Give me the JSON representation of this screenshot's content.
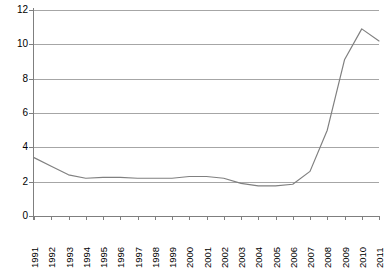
{
  "chart_data": {
    "type": "line",
    "title": "",
    "subtitle": "",
    "xlabel": "",
    "ylabel": "",
    "grid": true,
    "legend": false,
    "legend_position": "none",
    "line_color": "#808080",
    "categories": [
      "1991",
      "1992",
      "1993",
      "1994",
      "1995",
      "1996",
      "1997",
      "1998",
      "1999",
      "2000",
      "2001",
      "2002",
      "2003",
      "2004",
      "2005",
      "2006",
      "2007",
      "2008",
      "2009",
      "2010",
      "2011"
    ],
    "x": [
      1991,
      1992,
      1993,
      1994,
      1995,
      1996,
      1997,
      1998,
      1999,
      2000,
      2001,
      2002,
      2003,
      2004,
      2005,
      2006,
      2007,
      2008,
      2009,
      2010,
      2011
    ],
    "values": [
      3.4,
      2.9,
      2.4,
      2.2,
      2.25,
      2.25,
      2.2,
      2.2,
      2.2,
      2.3,
      2.3,
      2.2,
      1.9,
      1.75,
      1.75,
      1.85,
      2.6,
      5.0,
      9.1,
      10.9,
      10.2
    ],
    "xlim": [
      1991,
      2011
    ],
    "ylim": [
      0,
      12
    ],
    "y_ticks": [
      "0",
      "2",
      "4",
      "6",
      "8",
      "10",
      "12"
    ],
    "y_tick_values": [
      0,
      2,
      4,
      6,
      8,
      10,
      12
    ],
    "x_ticks": [
      "1991",
      "1992",
      "1993",
      "1994",
      "1995",
      "1996",
      "1997",
      "1998",
      "1999",
      "2000",
      "2001",
      "2002",
      "2003",
      "2004",
      "2005",
      "2006",
      "2007",
      "2008",
      "2009",
      "2010",
      "2011"
    ],
    "annotations": []
  }
}
